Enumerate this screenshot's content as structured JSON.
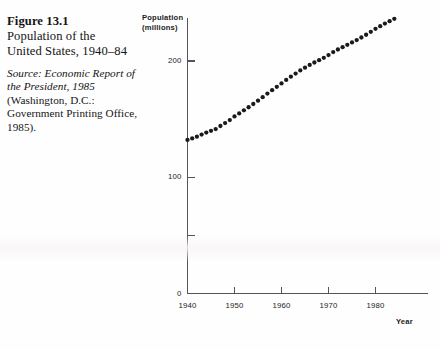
{
  "caption": {
    "figure_number": "Figure 13.1",
    "title_line_1": "Population of the",
    "title_line_2": "United States, 1940–84",
    "source_italic": "Source: Economic Report of the President, 1985",
    "source_rest": " (Washington, D.C.: Government Printing Office, 1985)."
  },
  "chart_data": {
    "type": "scatter",
    "title": "Population of the United States, 1940–84",
    "xlabel": "Year",
    "ylabel": "Population (millions)",
    "ylabel_line_1": "Population",
    "ylabel_line_2": "(millions)",
    "xlim": [
      1940,
      1985
    ],
    "ylim": [
      0,
      245
    ],
    "grid": false,
    "legend": "none",
    "marker": "filled-circle",
    "marker_color": "#1a1a1a",
    "axis_color": "#555555",
    "y_ticks": [
      0,
      50,
      100,
      200
    ],
    "y_tick_labels": [
      "0",
      "",
      "100",
      "200"
    ],
    "x_ticks": [
      1940,
      1950,
      1960,
      1970,
      1980
    ],
    "x_tick_labels": [
      "1940",
      "1950",
      "1960",
      "1970",
      "1980"
    ],
    "x": [
      1940,
      1941,
      1942,
      1943,
      1944,
      1945,
      1946,
      1947,
      1948,
      1949,
      1950,
      1951,
      1952,
      1953,
      1954,
      1955,
      1956,
      1957,
      1958,
      1959,
      1960,
      1961,
      1962,
      1963,
      1964,
      1965,
      1966,
      1967,
      1968,
      1969,
      1970,
      1971,
      1972,
      1973,
      1974,
      1975,
      1976,
      1977,
      1978,
      1979,
      1980,
      1981,
      1982,
      1983,
      1984
    ],
    "values": [
      132.1,
      133.4,
      134.9,
      136.7,
      138.4,
      139.9,
      141.4,
      144.1,
      146.6,
      149.2,
      152.3,
      154.9,
      157.6,
      160.2,
      163.0,
      165.9,
      168.9,
      172.0,
      174.9,
      177.8,
      180.7,
      183.7,
      186.5,
      189.2,
      191.9,
      194.3,
      196.6,
      198.7,
      200.7,
      202.7,
      205.1,
      207.7,
      209.9,
      211.9,
      213.9,
      216.0,
      218.0,
      220.2,
      222.6,
      225.1,
      227.7,
      230.0,
      232.2,
      234.3,
      236.3
    ]
  }
}
